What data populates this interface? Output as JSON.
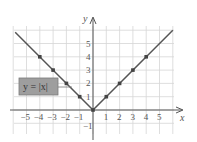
{
  "chart_data": {
    "type": "line",
    "title": "",
    "xlabel": "x",
    "ylabel": "y",
    "xlim": [
      -6,
      6
    ],
    "ylim": [
      -2,
      6
    ],
    "grid": true,
    "x_ticks": [
      "-5",
      "-4",
      "-3",
      "-2",
      "-1",
      "1",
      "2",
      "3",
      "4",
      "5"
    ],
    "y_ticks": [
      "-1",
      "1",
      "2",
      "3",
      "4",
      "5"
    ],
    "series": [
      {
        "name": "y = |x|",
        "x": [
          -4,
          -3,
          -2,
          -1,
          0,
          1,
          2,
          3,
          4
        ],
        "y": [
          4,
          3,
          2,
          1,
          0,
          1,
          2,
          3,
          4
        ],
        "color": "#555555"
      }
    ],
    "annotation": {
      "text": "y = |x|",
      "box_color": "#9a9a9a"
    }
  },
  "labels": {
    "x_axis": "x",
    "y_axis": "y",
    "equation": "y = |x|"
  }
}
